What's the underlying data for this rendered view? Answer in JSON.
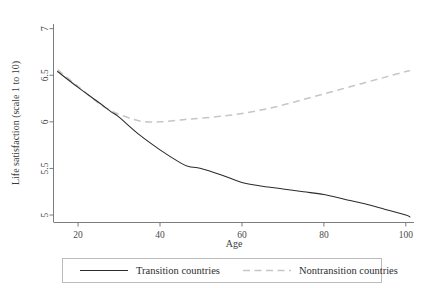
{
  "chart_data": {
    "type": "line",
    "title": "",
    "xlabel": "Age",
    "ylabel": "Life satisfaction (scale 1 to 10)",
    "xlim": [
      14,
      102
    ],
    "ylim": [
      4.92,
      7.05
    ],
    "xticks": [
      20,
      40,
      60,
      80,
      100
    ],
    "yticks": [
      5,
      5.5,
      6,
      6.5,
      7
    ],
    "xtick_labels": [
      "20",
      "40",
      "60",
      "80",
      "100"
    ],
    "ytick_labels": [
      "5",
      "5.5",
      "6",
      "6.5",
      "7"
    ],
    "grid": false,
    "legend_position": "bottom",
    "x": [
      15,
      20,
      25,
      28,
      30,
      35,
      40,
      45,
      47,
      50,
      55,
      60,
      65,
      70,
      75,
      80,
      85,
      90,
      95,
      100,
      101
    ],
    "series": [
      {
        "name": "Transition countries",
        "style": "solid",
        "color": "#2b2b2b",
        "values": [
          6.54,
          6.37,
          6.21,
          6.11,
          6.05,
          5.86,
          5.7,
          5.56,
          5.52,
          5.5,
          5.43,
          5.35,
          5.31,
          5.28,
          5.25,
          5.22,
          5.17,
          5.12,
          5.06,
          5.0,
          4.98
        ]
      },
      {
        "name": "Nontransition countries",
        "style": "dashed",
        "color": "#c6c6c6",
        "values": [
          6.56,
          6.38,
          6.2,
          6.12,
          6.08,
          6.01,
          6.0,
          6.02,
          6.03,
          6.04,
          6.06,
          6.09,
          6.13,
          6.18,
          6.24,
          6.3,
          6.36,
          6.42,
          6.48,
          6.54,
          6.55
        ]
      }
    ]
  },
  "legend": {
    "entries": [
      {
        "label": "Transition countries",
        "style": "solid"
      },
      {
        "label": "Nontransition countries",
        "style": "dashed"
      }
    ]
  }
}
